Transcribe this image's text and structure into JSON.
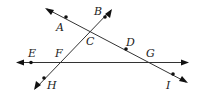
{
  "diagram": {
    "type": "geometry-lines",
    "lines": [
      {
        "name": "line-ACDGI",
        "points": [
          "A",
          "C",
          "D",
          "G",
          "I"
        ],
        "from": [
          45,
          8
        ],
        "to": [
          188,
          83
        ]
      },
      {
        "name": "line-BCFH",
        "points": [
          "B",
          "C",
          "F",
          "H"
        ],
        "from": [
          112,
          9
        ],
        "to": [
          34,
          90
        ]
      },
      {
        "name": "line-EFG",
        "points": [
          "E",
          "F",
          "G"
        ],
        "from": [
          16,
          62
        ],
        "to": [
          189,
          62
        ]
      }
    ],
    "points": [
      {
        "label": "A",
        "x": 66,
        "y": 17,
        "lx": 56,
        "ly": 31,
        "dot": true
      },
      {
        "label": "B",
        "x": 105,
        "y": 17,
        "lx": 95,
        "ly": 16,
        "dot": true
      },
      {
        "label": "C",
        "x": 92,
        "y": 31,
        "lx": 86,
        "ly": 45,
        "dot": false
      },
      {
        "label": "D",
        "x": 126,
        "y": 49,
        "lx": 126,
        "ly": 47,
        "dot": true
      },
      {
        "label": "E",
        "x": 31,
        "y": 62,
        "lx": 29,
        "ly": 57,
        "dot": true
      },
      {
        "label": "F",
        "x": 60,
        "y": 62,
        "lx": 55,
        "ly": 57,
        "dot": false
      },
      {
        "label": "G",
        "x": 152,
        "y": 62,
        "lx": 147,
        "ly": 57,
        "dot": false
      },
      {
        "label": "H",
        "x": 44,
        "y": 78,
        "lx": 48,
        "ly": 88,
        "dot": true
      },
      {
        "label": "I",
        "x": 173,
        "y": 74,
        "lx": 166,
        "ly": 88,
        "dot": true
      }
    ]
  }
}
